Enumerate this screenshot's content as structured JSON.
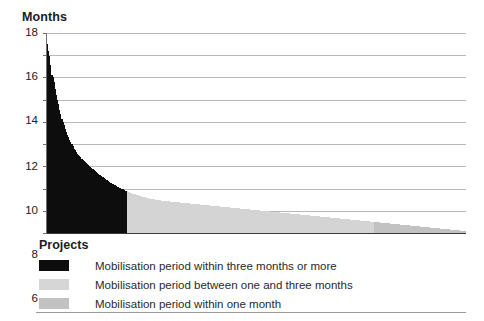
{
  "chart_data": {
    "type": "area",
    "title": "",
    "ylabel": "Months",
    "xlabel": "Projects",
    "ylim": [
      0,
      18
    ],
    "ytick_step": 2,
    "yticks": [
      18,
      16,
      14,
      12,
      10,
      8,
      6,
      4,
      2,
      0
    ],
    "grid": true,
    "legend_position": "below-axis-left",
    "x_tick_labels": [],
    "series": [
      {
        "name": "Mobilisation period within three months or more",
        "color": "#0d0d0d",
        "threshold_months": 3,
        "share_of_projects_pct": 19
      },
      {
        "name": "Mobilisation period between one and three months",
        "color": "#d4d4d4",
        "threshold_months": 1
      },
      {
        "name": "Mobilisation period within one month",
        "color": "#c2c2c2",
        "threshold_months": 0
      }
    ],
    "values": [
      17.0,
      16.4,
      15.9,
      15.1,
      14.2,
      14.0,
      13.6,
      13.0,
      12.4,
      12.0,
      11.6,
      11.1,
      10.7,
      10.3,
      10.0,
      9.7,
      9.4,
      9.1,
      8.8,
      8.6,
      8.4,
      8.2,
      8.0,
      7.8,
      7.6,
      7.45,
      7.3,
      7.15,
      7.0,
      6.9,
      6.8,
      6.7,
      6.6,
      6.5,
      6.4,
      6.3,
      6.2,
      6.1,
      6.0,
      5.9,
      5.82,
      5.74,
      5.66,
      5.58,
      5.5,
      5.42,
      5.34,
      5.26,
      5.18,
      5.1,
      5.02,
      4.95,
      4.88,
      4.81,
      4.74,
      4.67,
      4.6,
      4.54,
      4.48,
      4.42,
      4.36,
      4.3,
      4.24,
      4.18,
      4.12,
      4.07,
      4.02,
      3.97,
      3.92,
      3.87,
      3.82,
      3.78,
      3.74,
      3.7,
      3.66,
      3.62,
      3.58,
      3.54,
      3.5,
      3.47,
      3.44,
      3.41,
      3.38,
      3.35,
      3.32,
      3.29,
      3.26,
      3.23,
      3.2,
      3.17,
      3.14,
      3.12,
      3.1,
      3.08,
      3.06,
      3.04,
      3.02,
      3.01,
      3.0,
      3.0,
      2.98,
      2.96,
      2.94,
      2.92,
      2.9,
      2.89,
      2.88,
      2.87,
      2.86,
      2.85,
      2.84,
      2.83,
      2.82,
      2.81,
      2.8,
      2.79,
      2.78,
      2.77,
      2.76,
      2.75,
      2.74,
      2.73,
      2.72,
      2.71,
      2.7,
      2.69,
      2.68,
      2.67,
      2.66,
      2.65,
      2.64,
      2.63,
      2.62,
      2.61,
      2.6,
      2.59,
      2.58,
      2.57,
      2.56,
      2.55,
      2.54,
      2.53,
      2.52,
      2.51,
      2.5,
      2.49,
      2.48,
      2.47,
      2.46,
      2.45,
      2.44,
      2.43,
      2.42,
      2.41,
      2.4,
      2.39,
      2.38,
      2.37,
      2.36,
      2.35,
      2.34,
      2.33,
      2.32,
      2.31,
      2.3,
      2.29,
      2.28,
      2.27,
      2.26,
      2.25,
      2.24,
      2.23,
      2.22,
      2.21,
      2.2,
      2.19,
      2.18,
      2.17,
      2.16,
      2.15,
      2.14,
      2.13,
      2.12,
      2.11,
      2.1,
      2.09,
      2.08,
      2.07,
      2.06,
      2.05,
      2.04,
      2.03,
      2.02,
      2.01,
      2.0,
      1.99,
      1.98,
      1.97,
      1.96,
      1.95,
      1.94,
      1.93,
      1.92,
      1.91,
      1.9,
      1.89,
      1.88,
      1.87,
      1.86,
      1.85,
      1.84,
      1.83,
      1.82,
      1.81,
      1.8,
      1.79,
      1.78,
      1.77,
      1.76,
      1.75,
      1.74,
      1.73,
      1.72,
      1.71,
      1.7,
      1.69,
      1.68,
      1.67,
      1.66,
      1.65,
      1.64,
      1.63,
      1.62,
      1.61,
      1.6,
      1.59,
      1.58,
      1.57,
      1.56,
      1.55,
      1.54,
      1.53,
      1.52,
      1.51,
      1.5,
      1.49,
      1.48,
      1.47,
      1.46,
      1.45,
      1.44,
      1.43,
      1.42,
      1.41,
      1.4,
      1.39,
      1.38,
      1.37,
      1.36,
      1.35,
      1.34,
      1.33,
      1.32,
      1.31,
      1.3,
      1.29,
      1.28,
      1.27,
      1.26,
      1.25,
      1.24,
      1.23,
      1.22,
      1.21,
      1.2,
      1.19,
      1.18,
      1.17,
      1.16,
      1.15,
      1.14,
      1.13,
      1.12,
      1.11,
      1.1,
      1.09,
      1.08,
      1.07,
      1.06,
      1.05,
      1.04,
      1.03,
      1.02,
      1.01,
      1.0,
      0.99,
      0.98,
      0.97,
      0.96,
      0.95,
      0.94,
      0.93,
      0.92,
      0.91,
      0.9,
      0.89,
      0.88,
      0.87,
      0.86,
      0.85,
      0.84,
      0.83,
      0.82,
      0.81,
      0.8,
      0.79,
      0.78,
      0.77,
      0.76,
      0.75,
      0.74,
      0.73,
      0.72,
      0.71,
      0.7,
      0.69,
      0.68,
      0.67,
      0.66,
      0.65,
      0.64,
      0.63,
      0.62,
      0.61,
      0.6,
      0.59,
      0.58,
      0.57,
      0.56,
      0.55,
      0.54,
      0.53,
      0.52,
      0.51,
      0.5,
      0.49,
      0.48,
      0.47,
      0.46,
      0.45,
      0.44,
      0.43,
      0.42,
      0.41,
      0.4,
      0.39,
      0.38,
      0.37,
      0.36,
      0.35,
      0.34,
      0.33,
      0.32,
      0.31,
      0.3,
      0.29,
      0.28,
      0.27,
      0.26,
      0.25,
      0.24,
      0.23,
      0.22,
      0.21,
      0.2,
      0.19,
      0.18,
      0.17,
      0.16,
      0.15
    ]
  },
  "legend": {
    "items": [
      {
        "label": "Mobilisation period within three months or more",
        "color": "#0d0d0d"
      },
      {
        "label": "Mobilisation period between one and three months",
        "color": "#d6d6d6"
      },
      {
        "label": "Mobilisation period within one month",
        "color": "#c2c2c2"
      }
    ]
  },
  "axes": {
    "y_title": "Months",
    "x_title": "Projects"
  }
}
